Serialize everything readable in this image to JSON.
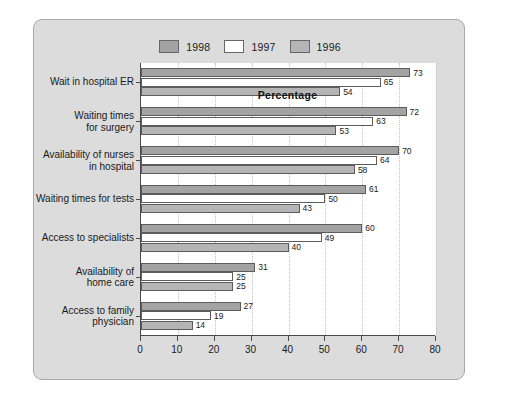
{
  "chart_data": {
    "type": "bar",
    "orientation": "horizontal",
    "title": "",
    "xlabel": "Percentage",
    "ylabel": "",
    "xlim": [
      0,
      80
    ],
    "xticks": [
      0,
      10,
      20,
      30,
      40,
      50,
      60,
      70,
      80
    ],
    "grid": "vertical-dotted",
    "legend_position": "top-center",
    "categories": [
      "Wait in hospital ER",
      "Waiting times\nfor surgery",
      "Availability of nurses\nin hospital",
      "Waiting times for tests",
      "Access to specialists",
      "Availability of\nhome care",
      "Access to family\nphysician"
    ],
    "series": [
      {
        "name": "1998",
        "color": "#a3a3a3",
        "values": [
          73,
          72,
          70,
          61,
          60,
          31,
          27
        ]
      },
      {
        "name": "1997",
        "color": "#ffffff",
        "values": [
          65,
          63,
          64,
          50,
          49,
          25,
          19
        ]
      },
      {
        "name": "1996",
        "color": "#b5b5b5",
        "values": [
          54,
          53,
          58,
          43,
          40,
          25,
          14
        ]
      }
    ]
  },
  "legend": {
    "entries": [
      {
        "label": "1998",
        "color": "#a3a3a3"
      },
      {
        "label": "1997",
        "color": "#ffffff"
      },
      {
        "label": "1996",
        "color": "#b5b5b5"
      }
    ]
  },
  "axis": {
    "x_title": "Percentage",
    "tick_labels": [
      "0",
      "10",
      "20",
      "30",
      "40",
      "50",
      "60",
      "70",
      "80"
    ]
  },
  "colors": {
    "panel_background": "#dcdcdc",
    "panel_border": "#a8a8a8",
    "plot_background": "#ffffff",
    "axis_line": "#4a4a4a",
    "gridline": "#c2c2c2",
    "bar_border": "#5c5c5c",
    "text": "#1a1a1a"
  }
}
